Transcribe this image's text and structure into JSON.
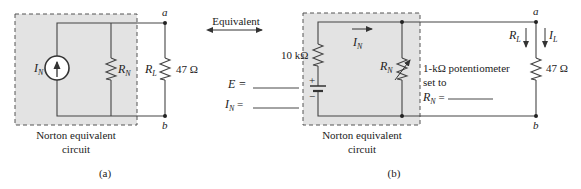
{
  "panel_a": {
    "caption": "(a)",
    "box_label_line1": "Norton equivalent",
    "box_label_line2": "circuit",
    "source_label": "I",
    "source_sub": "N",
    "rn_label": "R",
    "rn_sub": "N",
    "rl_label": "R",
    "rl_sub": "L",
    "rl_value": "47 Ω",
    "node_a": "a",
    "node_b": "b"
  },
  "equivalent_label": "Equivalent",
  "panel_b": {
    "caption": "(b)",
    "box_label_line1": "Norton equivalent",
    "box_label_line2": "circuit",
    "series_resistor_value": "10 kΩ",
    "battery_plus": "+",
    "battery_minus": "−",
    "current_label": "I",
    "current_sub": "N",
    "pot_label": "R",
    "pot_sub": "N",
    "pot_desc_line1": "1-kΩ potentiometer",
    "pot_desc_line2": "set to",
    "pot_set_label": "R",
    "pot_set_sub": "N",
    "pot_set_eq": " =",
    "e_label": "E =",
    "in_label": "I",
    "in_sub": "N",
    "in_eq": " =",
    "rl_arrow_label": "R",
    "rl_arrow_sub": "L",
    "il_arrow_label": "I",
    "il_arrow_sub": "L",
    "rl_value": "47 Ω",
    "node_a": "a",
    "node_b": "b"
  },
  "colors": {
    "box_fill": "#e3e3e3",
    "line": "#444444"
  }
}
